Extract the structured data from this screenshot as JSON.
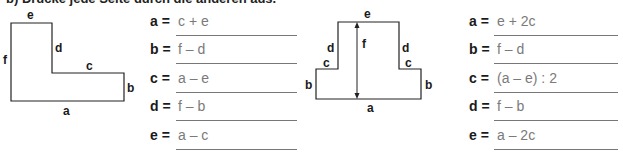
{
  "header": {
    "text": "b) Drücke jede Seite durch die anderen aus."
  },
  "exercise_left": {
    "figure": {
      "shape": "L-shape",
      "labels": {
        "a": "a",
        "b": "b",
        "c": "c",
        "d": "d",
        "e": "e",
        "f": "f"
      }
    },
    "equations": [
      {
        "variable": "a =",
        "answer": "c + e"
      },
      {
        "variable": "b =",
        "answer": "f – d"
      },
      {
        "variable": "c =",
        "answer": "a – e"
      },
      {
        "variable": "d =",
        "answer": "f – b"
      },
      {
        "variable": "e =",
        "answer": "a – c"
      }
    ]
  },
  "exercise_right": {
    "figure": {
      "shape": "stepped-T-shape",
      "labels": {
        "a": "a",
        "b_left": "b",
        "b_right": "b",
        "c_left": "c",
        "c_right": "c",
        "d_left": "d",
        "d_right": "d",
        "e": "e",
        "f": "f"
      }
    },
    "equations": [
      {
        "variable": "a =",
        "answer": "e + 2c"
      },
      {
        "variable": "b =",
        "answer": "f – d"
      },
      {
        "variable": "c =",
        "answer": "(a – e) : 2"
      },
      {
        "variable": "d =",
        "answer": "f – b"
      },
      {
        "variable": "e =",
        "answer": "a – 2c"
      }
    ]
  }
}
